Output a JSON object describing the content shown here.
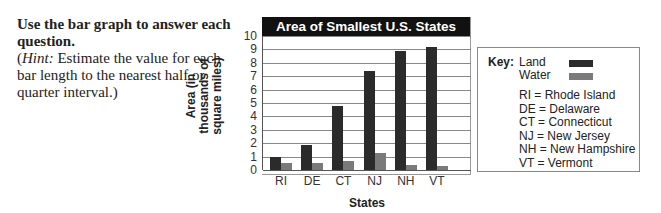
{
  "instructions": {
    "bold_text": "Use the bar graph to answer each question.",
    "hint_label": "Hint:",
    "hint_text": " Estimate the value for each bar length to the nearest half or quarter interval.)",
    "hint_open": "("
  },
  "chart_data": {
    "type": "bar",
    "title": "Area of Smallest U.S. States",
    "xlabel": "States",
    "ylabel": "Area (in thousands of square miles)",
    "ylim": [
      0,
      10
    ],
    "yticks": [
      0,
      1,
      2,
      3,
      4,
      5,
      6,
      7,
      8,
      9,
      10
    ],
    "grid": true,
    "legend_position": "right",
    "categories": [
      "RI",
      "DE",
      "CT",
      "NJ",
      "NH",
      "VT"
    ],
    "series": [
      {
        "name": "Land",
        "color": "#2b2b2b",
        "values": [
          1.0,
          1.9,
          4.8,
          7.4,
          8.9,
          9.2
        ]
      },
      {
        "name": "Water",
        "color": "#7a7a7a",
        "values": [
          0.5,
          0.5,
          0.7,
          1.3,
          0.4,
          0.3
        ]
      }
    ]
  },
  "key": {
    "title": "Key:",
    "land_label": "Land",
    "water_label": "Water",
    "abbreviations": [
      "RI  = Rhode Island",
      "DE = Delaware",
      "CT = Connecticut",
      "NJ  = New Jersey",
      "NH = New Hampshire",
      "VT = Vermont"
    ]
  }
}
